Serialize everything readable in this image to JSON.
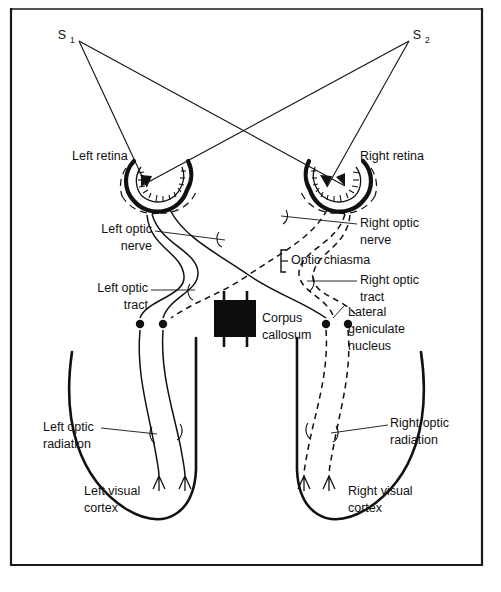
{
  "figure": {
    "frame_color": "#1a1a1a",
    "ink_color": "#111111",
    "background": "#ffffff"
  },
  "sources": {
    "left": {
      "label": "S",
      "subscript": "1",
      "x": 62,
      "y": 36
    },
    "right": {
      "label": "S",
      "subscript": "2",
      "x": 414,
      "y": 36
    }
  },
  "labels": {
    "left_retina": {
      "line1": "Left retina",
      "x": 72,
      "y": 157,
      "anchor": "start"
    },
    "right_retina": {
      "line1": "Right retina",
      "x": 360,
      "y": 157,
      "anchor": "start"
    },
    "left_optic_nerve": {
      "line1": "Left optic",
      "line2": "nerve",
      "x": 152,
      "y": 230,
      "anchor": "end"
    },
    "right_optic_nerve": {
      "line1": "Right optic",
      "line2": "nerve",
      "x": 360,
      "y": 224,
      "anchor": "start"
    },
    "optic_chiasma": {
      "line1": "Optic chiasma",
      "x": 291,
      "y": 261,
      "anchor": "start"
    },
    "left_optic_tract": {
      "line1": "Left optic",
      "line2": "tract",
      "x": 148,
      "y": 289,
      "anchor": "end"
    },
    "right_optic_tract": {
      "line1": "Right optic",
      "line2": "tract",
      "x": 360,
      "y": 281,
      "anchor": "start"
    },
    "corpus_callosum": {
      "line1": "Corpus",
      "line2": "callosum",
      "x": 262,
      "y": 319,
      "anchor": "start"
    },
    "lateral_geniculate_nucleus": {
      "line1": "Lateral",
      "line2": "geniculate",
      "line3": "nucleus",
      "x": 348,
      "y": 313,
      "anchor": "start"
    },
    "left_optic_radiation": {
      "line1": "Left optic",
      "line2": "radiation",
      "x": 43,
      "y": 428,
      "anchor": "start"
    },
    "right_optic_radiation": {
      "line1": "Right optic",
      "line2": "radiation",
      "x": 390,
      "y": 424,
      "anchor": "start"
    },
    "left_visual_cortex": {
      "line1": "Left visual",
      "line2": "cortex",
      "x": 84,
      "y": 492,
      "anchor": "start"
    },
    "right_visual_cortex": {
      "line1": "Right visual",
      "line2": "cortex",
      "x": 348,
      "y": 492,
      "anchor": "start"
    }
  },
  "structures": {
    "left_eye": {
      "name": "left-eye",
      "cx": 160,
      "cy": 186
    },
    "right_eye": {
      "name": "right-eye",
      "cx": 337,
      "cy": 186
    },
    "corpus_callosum_block": {
      "name": "corpus-callosum-block",
      "x": 214,
      "y": 300,
      "w": 42,
      "h": 37,
      "fill": "#0d0d0d"
    },
    "lgn_dots": [
      {
        "cx": 140,
        "cy": 324
      },
      {
        "cx": 163,
        "cy": 324
      },
      {
        "cx": 326,
        "cy": 324
      },
      {
        "cx": 348,
        "cy": 324
      }
    ]
  },
  "pathway_style": {
    "left_tract": "solid",
    "right_tract": "dashed",
    "note_left": "Left hemisphere pathway drawn with solid lines",
    "note_right": "Right hemisphere pathway drawn with dashed lines"
  }
}
